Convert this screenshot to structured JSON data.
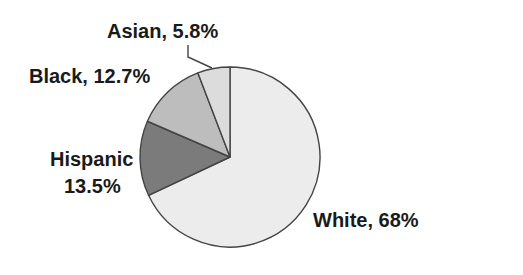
{
  "chart_data": {
    "type": "pie",
    "title": "",
    "start_angle_deg": 0,
    "direction": "clockwise",
    "slices": [
      {
        "name": "White",
        "value": 68,
        "label": "White, 68%",
        "color": "#ececec"
      },
      {
        "name": "Hispanic",
        "value": 13.5,
        "label_line1": "Hispanic",
        "label_line2": "13.5%",
        "color": "#7b7b7b"
      },
      {
        "name": "Black",
        "value": 12.7,
        "label": "Black, 12.7%",
        "color": "#bdbdbd"
      },
      {
        "name": "Asian",
        "value": 5.8,
        "label": "Asian, 5.8%",
        "color": "#dcdcdc"
      }
    ],
    "categories": [
      "White",
      "Hispanic",
      "Black",
      "Asian"
    ],
    "values": [
      68,
      13.5,
      12.7,
      5.8
    ],
    "unit": "%",
    "stroke_color": "#444444",
    "legend": "none (direct labels)",
    "leader_lines": [
      "Asian"
    ]
  }
}
